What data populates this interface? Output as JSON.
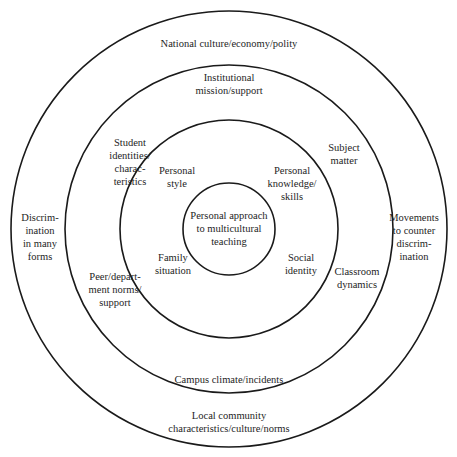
{
  "diagram": {
    "type": "concentric-circles",
    "rings": [
      {
        "level": "outer",
        "labels": {
          "top": [
            "National culture/economy/polity"
          ],
          "left": [
            "Discrim-",
            "ination",
            "in many",
            "forms"
          ],
          "right": [
            "Movements",
            "to counter",
            "discrim-",
            "ination"
          ],
          "bottom": [
            "Local community",
            "characteristics/culture/norms"
          ]
        }
      },
      {
        "level": "institutional",
        "labels": {
          "top": [
            "Institutional",
            "mission/support"
          ],
          "upper_left": [
            "Student",
            "identities/",
            "charac-",
            "teristics"
          ],
          "upper_right": [
            "Subject",
            "matter"
          ],
          "lower_left": [
            "Peer/depart-",
            "ment norms/",
            "support"
          ],
          "lower_right": [
            "Classroom",
            "dynamics"
          ],
          "bottom": [
            "Campus climate/incidents"
          ]
        }
      },
      {
        "level": "personal",
        "labels": {
          "upper_left": [
            "Personal",
            "style"
          ],
          "upper_right": [
            "Personal",
            "knowledge/",
            "skills"
          ],
          "lower_left": [
            "Family",
            "situation"
          ],
          "lower_right": [
            "Social",
            "identity"
          ]
        }
      },
      {
        "level": "core",
        "labels": {
          "center": [
            "Personal approach",
            "to multicultural",
            "teaching"
          ]
        }
      }
    ]
  }
}
